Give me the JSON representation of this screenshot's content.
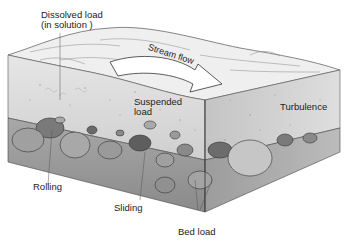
{
  "diagram": {
    "labels": {
      "dissolved_load_line1": "Dissolved load",
      "dissolved_load_line2": "(in solution )",
      "stream_flow": "Stream flow",
      "suspended_load_line1": "Suspended",
      "suspended_load_line2": "load",
      "turbulence": "Turbulence",
      "rolling": "Rolling",
      "sliding": "Sliding",
      "bed_load": "Bed load"
    },
    "colors": {
      "water_face": "#dcdcdc",
      "water_top": "#eeeeee",
      "bed": "#9a9a9a",
      "pebble_dark": "#5a5a5a",
      "pebble_mid": "#8a8a8a",
      "arrow": "#ffffff",
      "outline": "#333333"
    }
  }
}
